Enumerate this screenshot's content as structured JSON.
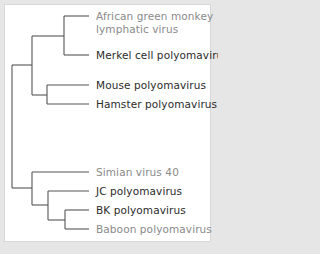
{
  "diagram": {
    "type": "phylogenetic-tree",
    "title": "",
    "colors": {
      "background": "#e6e6e6",
      "panel": "#ffffff",
      "branch": "#555555",
      "label_dark": "#2b2b2b",
      "label_light": "#8a8a8a"
    },
    "leaves": [
      {
        "id": "agm",
        "line1": "African green monkey",
        "line2": "lymphatic virus",
        "tone": "light"
      },
      {
        "id": "merkel",
        "line1": "Merkel cell polyomavirus",
        "tone": "dark"
      },
      {
        "id": "mouse",
        "line1": "Mouse polyomavirus",
        "tone": "dark"
      },
      {
        "id": "hamster",
        "line1": "Hamster polyomavirus",
        "tone": "dark"
      },
      {
        "id": "sv40",
        "line1": "Simian virus 40",
        "tone": "light"
      },
      {
        "id": "jc",
        "line1": "JC polyomavirus",
        "tone": "dark"
      },
      {
        "id": "bk",
        "line1": "BK polyomavirus",
        "tone": "dark"
      },
      {
        "id": "baboon",
        "line1": "Baboon polyomavirus",
        "tone": "light"
      }
    ],
    "topology": "((((African green monkey lymphatic virus, Merkel cell polyomavirus), (Mouse polyomavirus, Hamster polyomavirus)), (Simian virus 40, (JC polyomavirus, (BK polyomavirus, Baboon polyomavirus)))))"
  }
}
